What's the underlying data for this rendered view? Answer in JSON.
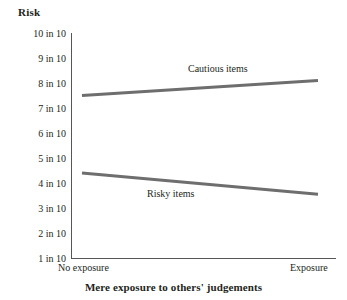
{
  "chart_data": {
    "type": "line",
    "title": "",
    "ylabel": "Risk",
    "xlabel": "Mere exposure to others' judgements",
    "categories": [
      "No exposure",
      "Exposure"
    ],
    "x_tick_labels": [
      "No exposure",
      "Exposure"
    ],
    "y_tick_labels": [
      "10 in 10",
      "9 in 10",
      "8 in 10",
      "7 in 10",
      "6 in 10",
      "5 in 10",
      "4 in 10",
      "3 in 10",
      "2 in 10",
      "1 in 10"
    ],
    "y_tick_values": [
      10,
      9,
      8,
      7,
      6,
      5,
      4,
      3,
      2,
      1
    ],
    "ylim": [
      1,
      10
    ],
    "grid": false,
    "legend_position": "inline-annotation",
    "series": [
      {
        "name": "Cautious items",
        "label": "Cautious items",
        "values": [
          7.5,
          8.1
        ],
        "color": "#6e6e6e"
      },
      {
        "name": "Risky items",
        "label": "Risky items",
        "values": [
          4.4,
          3.55
        ],
        "color": "#6e6e6e"
      }
    ],
    "annotations": [
      {
        "text": "Cautious items",
        "series": "Cautious items"
      },
      {
        "text": "Risky items",
        "series": "Risky items"
      }
    ],
    "colors": {
      "line": "#6e6e6e",
      "axis": "#55565a",
      "text": "#231f20",
      "background": "#ffffff"
    }
  },
  "axes": {
    "y_title": "Risk",
    "x_title": "Mere exposure to others' judgements"
  },
  "ticks": {
    "y": [
      {
        "label": "10 in 10"
      },
      {
        "label": "9 in 10"
      },
      {
        "label": "8 in 10"
      },
      {
        "label": "7 in 10"
      },
      {
        "label": "6 in 10"
      },
      {
        "label": "5 in 10"
      },
      {
        "label": "4 in 10"
      },
      {
        "label": "3 in 10"
      },
      {
        "label": "2 in 10"
      },
      {
        "label": "1 in 10"
      }
    ],
    "x": [
      {
        "label": "No exposure"
      },
      {
        "label": "Exposure"
      }
    ]
  },
  "series_labels": {
    "cautious": "Cautious items",
    "risky": "Risky items"
  }
}
